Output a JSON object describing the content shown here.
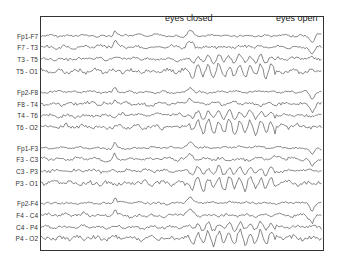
{
  "annotations": [
    {
      "text": "eyes closed",
      "x": 165,
      "y": 15
    },
    {
      "text": "eyes open",
      "x": 276,
      "y": 15
    }
  ],
  "frame": {
    "left": 40,
    "top": 16,
    "right": 324,
    "bottom": 251
  },
  "events": {
    "eyes_closed_x": 190,
    "eyes_open_x": 312
  },
  "alpha_window": {
    "start_x": 190,
    "end_x": 276
  },
  "channels": [
    {
      "label": "Fp1-F7",
      "y": 36,
      "type": "frontal"
    },
    {
      "label": "F7 - T3",
      "y": 47,
      "type": "mid"
    },
    {
      "label": "T3 - T5",
      "y": 59,
      "type": "mid"
    },
    {
      "label": "T5 - O1",
      "y": 71,
      "type": "occipital"
    },
    {
      "label": "Fp2-F8",
      "y": 92,
      "type": "frontal"
    },
    {
      "label": "F8 - T4",
      "y": 104,
      "type": "mid"
    },
    {
      "label": "T4 - T6",
      "y": 115,
      "type": "mid"
    },
    {
      "label": "T6 - O2",
      "y": 127,
      "type": "occipital"
    },
    {
      "label": "Fp1-F3",
      "y": 148,
      "type": "frontal"
    },
    {
      "label": "F3 - C3",
      "y": 159,
      "type": "mid"
    },
    {
      "label": "C3 - P3",
      "y": 171,
      "type": "mid"
    },
    {
      "label": "P3 - O1",
      "y": 183,
      "type": "occipital"
    },
    {
      "label": "Fp2-F4",
      "y": 203,
      "type": "frontal"
    },
    {
      "label": "F4 - C4",
      "y": 215,
      "type": "mid"
    },
    {
      "label": "C4 - P4",
      "y": 227,
      "type": "mid"
    },
    {
      "label": "P4 - O2",
      "y": 238,
      "type": "occipital"
    }
  ],
  "colors": {
    "trace": "#555555",
    "frame": "#333333",
    "text": "#333333"
  }
}
